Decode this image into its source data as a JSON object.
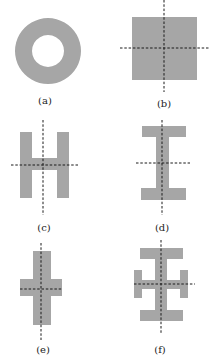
{
  "figure": {
    "shape_color": "#a6a6a6",
    "axis_color": "#1a1a1a",
    "background": "#ffffff",
    "panels": [
      {
        "id": "a",
        "label": "(a)",
        "shape": "ring",
        "axes": false
      },
      {
        "id": "b",
        "label": "(b)",
        "shape": "square",
        "axes": true
      },
      {
        "id": "c",
        "label": "(c)",
        "shape": "H-section",
        "axes": true
      },
      {
        "id": "d",
        "label": "(d)",
        "shape": "I-section",
        "axes": true
      },
      {
        "id": "e",
        "label": "(e)",
        "shape": "cross",
        "axes": true
      },
      {
        "id": "f",
        "label": "(f)",
        "shape": "I-section with side flanges",
        "axes": true
      }
    ]
  }
}
